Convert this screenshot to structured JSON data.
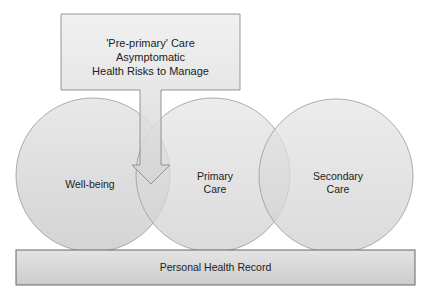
{
  "diagram": {
    "callout": {
      "lines": [
        "'Pre-primary' Care",
        "Asymptomatic",
        "Health Risks to Manage"
      ]
    },
    "circles": [
      {
        "id": "well-being",
        "lines": [
          "Well-being"
        ]
      },
      {
        "id": "primary-care",
        "lines": [
          "Primary",
          "Care"
        ]
      },
      {
        "id": "secondary-care",
        "lines": [
          "Secondary",
          "Care"
        ]
      }
    ],
    "base_bar": {
      "label": "Personal Health Record"
    },
    "colors": {
      "fill": "#d6d6d6",
      "stroke": "#8a8a8a",
      "text": "#222222"
    }
  }
}
